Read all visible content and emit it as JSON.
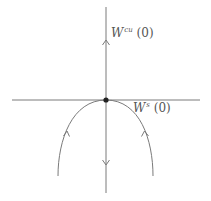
{
  "diagram": {
    "colors": {
      "line": "#7a7a7a",
      "dot": "#222222",
      "text": "#555555"
    },
    "labels": {
      "unstable": {
        "symbol": "W",
        "superscript": "cu",
        "arg": "(0)"
      },
      "stable": {
        "symbol": "W",
        "superscript": "s",
        "arg": "(0)"
      }
    },
    "origin": {
      "x": 106,
      "y": 100
    }
  }
}
